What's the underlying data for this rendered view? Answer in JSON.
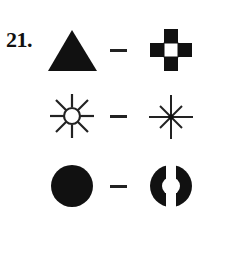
{
  "question": {
    "number_label": "21.",
    "pairs": [
      {
        "left": "filled-triangle",
        "separator": "–",
        "right": "cross-of-four-filled-squares"
      },
      {
        "left": "sun-circle-with-rays",
        "separator": "–",
        "right": "eight-point-asterisk"
      },
      {
        "left": "filled-circle",
        "separator": "–",
        "right": "split-filled-circle"
      }
    ]
  },
  "colors": {
    "ink": "#111111",
    "background": "#ffffff"
  }
}
